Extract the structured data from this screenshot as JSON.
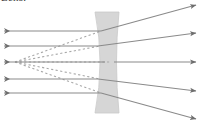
{
  "figure": {
    "caption_fragment": "Lens.",
    "width": 203,
    "height": 124,
    "background_color": "#ffffff"
  },
  "colors": {
    "ray_solid": "#8a8a8a",
    "ray_dashed": "#a8a8a8",
    "arrow_head": "#6e6e6e",
    "lens_fill": "#d6d6d6",
    "lens_edge": "#c9c9c9",
    "caption_text": "#3a3a3a"
  },
  "lens": {
    "name": "biconcave-diverging-lens",
    "type": "concave",
    "left_edge_x": 95,
    "right_edge_x": 119,
    "waist_left_x": 105,
    "waist_right_x": 114,
    "top_y": 12,
    "bottom_y": 113,
    "center_y": 62,
    "fill": "#d6d6d6"
  },
  "optical_axis": {
    "name": "optical-axis",
    "y": 62,
    "x_start": 4,
    "x_end": 199
  },
  "virtual_focal_point": {
    "name": "virtual-focal-point",
    "x": 15,
    "y": 62,
    "label": ""
  },
  "incoming_rays": [
    {
      "id": "incoming-ray-1",
      "y": 31,
      "x_start": 4,
      "x_end": 101,
      "arrow_x": 10,
      "arrow_y": 31
    },
    {
      "id": "incoming-ray-2",
      "y": 46,
      "x_start": 4,
      "x_end": 98,
      "arrow_x": 10,
      "arrow_y": 46
    },
    {
      "id": "incoming-ray-3",
      "y": 62,
      "x_start": 4,
      "x_end": 105,
      "arrow_x": 10,
      "arrow_y": 62
    },
    {
      "id": "incoming-ray-4",
      "y": 79,
      "x_start": 4,
      "x_end": 98,
      "arrow_x": 10,
      "arrow_y": 79
    },
    {
      "id": "incoming-ray-5",
      "y": 93,
      "x_start": 4,
      "x_end": 101,
      "arrow_x": 10,
      "arrow_y": 93
    }
  ],
  "outgoing_rays": [
    {
      "id": "outgoing-ray-1",
      "x_start": 101,
      "y_start": 31,
      "x_end": 196,
      "y_end": 5
    },
    {
      "id": "outgoing-ray-2",
      "x_start": 98,
      "y_start": 46,
      "x_end": 196,
      "y_end": 33
    },
    {
      "id": "outgoing-ray-3",
      "x_start": 114,
      "y_start": 62,
      "x_end": 196,
      "y_end": 62
    },
    {
      "id": "outgoing-ray-4",
      "x_start": 98,
      "y_start": 79,
      "x_end": 196,
      "y_end": 91
    },
    {
      "id": "outgoing-ray-5",
      "x_start": 101,
      "y_start": 93,
      "x_end": 196,
      "y_end": 119
    }
  ],
  "construction_lines": [
    {
      "id": "dashed-extension-1",
      "x_start": 15,
      "y_start": 62,
      "x_end": 101,
      "y_end": 31
    },
    {
      "id": "dashed-extension-2",
      "x_start": 15,
      "y_start": 62,
      "x_end": 100,
      "y_end": 46
    },
    {
      "id": "dashed-extension-3",
      "x_start": 15,
      "y_start": 62,
      "x_end": 110,
      "y_end": 62
    },
    {
      "id": "dashed-extension-4",
      "x_start": 15,
      "y_start": 62,
      "x_end": 100,
      "y_end": 79
    },
    {
      "id": "dashed-extension-5",
      "x_start": 15,
      "y_start": 62,
      "x_end": 101,
      "y_end": 93
    }
  ],
  "dash_pattern": "2.2 2.4",
  "stroke_widths": {
    "ray": 1.1,
    "dashed": 1.1,
    "lens_edge": 0.8
  }
}
